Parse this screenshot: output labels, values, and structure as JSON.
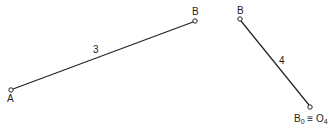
{
  "diagram": {
    "link3": {
      "label": "3",
      "start_label": "A",
      "end_label": "B",
      "start": [
        11,
        90
      ],
      "end": [
        195,
        21
      ]
    },
    "link4": {
      "label": "4",
      "start_label": "B",
      "end_label_main": "B",
      "end_label_sub1": "0",
      "end_label_eq": " ≡ O",
      "end_label_sub2": "4",
      "start": [
        240,
        19
      ],
      "end": [
        310,
        107
      ]
    },
    "colors": {
      "line": "#222222",
      "background": "#ffffff"
    }
  }
}
